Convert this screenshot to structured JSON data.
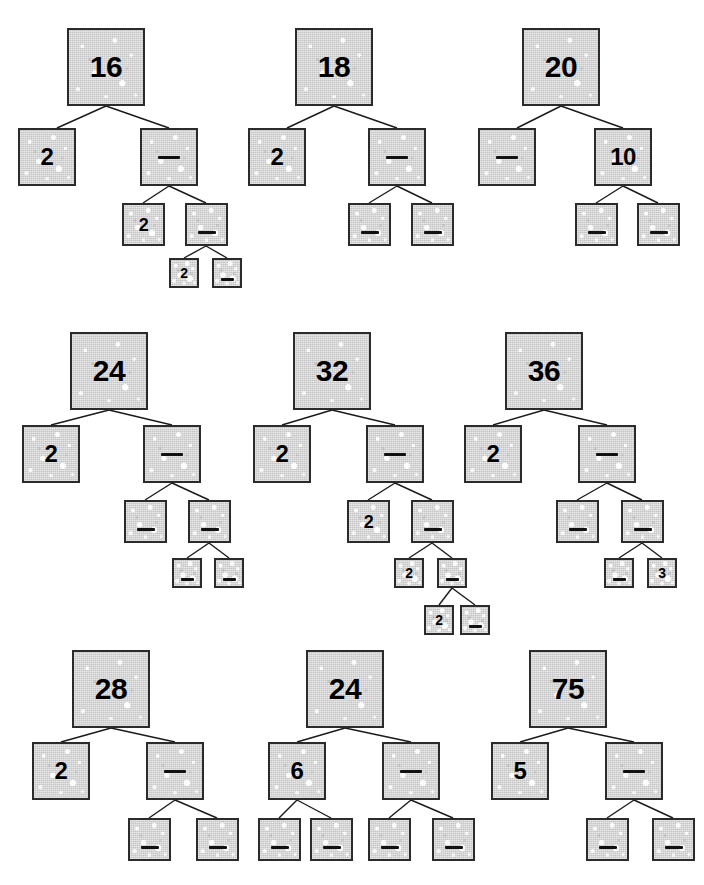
{
  "worksheet": {
    "title": "Factor Trees Worksheet",
    "blank_marker": "",
    "ink_color": "#1a1a1a",
    "box_fill_color": "#d9d9d9",
    "box_border_color": "#2b2b2b"
  },
  "trees": [
    {
      "id": "tree-16",
      "root_value": "16",
      "nodes": [
        {
          "name": "root",
          "value": "16",
          "blank": false,
          "size": 1,
          "x": 67,
          "y": 28
        },
        {
          "name": "l1-left",
          "value": "2",
          "blank": false,
          "size": 2,
          "x": 18,
          "y": 128
        },
        {
          "name": "l1-right",
          "value": "",
          "blank": true,
          "size": 2,
          "x": 140,
          "y": 128
        },
        {
          "name": "l2-left",
          "value": "2",
          "blank": false,
          "size": 3,
          "x": 122,
          "y": 203
        },
        {
          "name": "l2-right",
          "value": "",
          "blank": true,
          "size": 3,
          "x": 185,
          "y": 203
        },
        {
          "name": "l3-left",
          "value": "2",
          "blank": false,
          "size": 4,
          "x": 169,
          "y": 258
        },
        {
          "name": "l3-right",
          "value": "",
          "blank": true,
          "size": 4,
          "x": 212,
          "y": 258
        }
      ],
      "edges": [
        [
          106,
          106,
          57,
          128
        ],
        [
          106,
          106,
          169,
          128
        ],
        [
          169,
          186,
          143,
          203
        ],
        [
          169,
          186,
          206,
          203
        ],
        [
          206,
          246,
          184,
          258
        ],
        [
          206,
          246,
          227,
          258
        ]
      ]
    },
    {
      "id": "tree-18",
      "root_value": "18",
      "nodes": [
        {
          "name": "root",
          "value": "18",
          "blank": false,
          "size": 1,
          "x": 295,
          "y": 28
        },
        {
          "name": "l1-left",
          "value": "2",
          "blank": false,
          "size": 2,
          "x": 248,
          "y": 128
        },
        {
          "name": "l1-right",
          "value": "",
          "blank": true,
          "size": 2,
          "x": 368,
          "y": 128
        },
        {
          "name": "l2-left",
          "value": "",
          "blank": true,
          "size": 3,
          "x": 348,
          "y": 203
        },
        {
          "name": "l2-right",
          "value": "",
          "blank": true,
          "size": 3,
          "x": 411,
          "y": 203
        }
      ],
      "edges": [
        [
          334,
          106,
          287,
          128
        ],
        [
          334,
          106,
          397,
          128
        ],
        [
          397,
          186,
          369,
          203
        ],
        [
          397,
          186,
          432,
          203
        ]
      ]
    },
    {
      "id": "tree-20",
      "root_value": "20",
      "nodes": [
        {
          "name": "root",
          "value": "20",
          "blank": false,
          "size": 1,
          "x": 522,
          "y": 28
        },
        {
          "name": "l1-left",
          "value": "",
          "blank": true,
          "size": 2,
          "x": 478,
          "y": 128
        },
        {
          "name": "l1-right",
          "value": "10",
          "blank": false,
          "size": 2,
          "x": 594,
          "y": 128
        },
        {
          "name": "l2-left",
          "value": "",
          "blank": true,
          "size": 3,
          "x": 575,
          "y": 203
        },
        {
          "name": "l2-right",
          "value": "",
          "blank": true,
          "size": 3,
          "x": 637,
          "y": 203
        }
      ],
      "edges": [
        [
          561,
          106,
          517,
          128
        ],
        [
          561,
          106,
          623,
          128
        ],
        [
          623,
          186,
          596,
          203
        ],
        [
          623,
          186,
          658,
          203
        ]
      ]
    },
    {
      "id": "tree-24-a",
      "root_value": "24",
      "nodes": [
        {
          "name": "root",
          "value": "24",
          "blank": false,
          "size": 1,
          "x": 70,
          "y": 332
        },
        {
          "name": "l1-left",
          "value": "2",
          "blank": false,
          "size": 2,
          "x": 22,
          "y": 425
        },
        {
          "name": "l1-right",
          "value": "",
          "blank": true,
          "size": 2,
          "x": 143,
          "y": 425
        },
        {
          "name": "l2-left",
          "value": "",
          "blank": true,
          "size": 3,
          "x": 124,
          "y": 500
        },
        {
          "name": "l2-right",
          "value": "",
          "blank": true,
          "size": 3,
          "x": 188,
          "y": 500
        },
        {
          "name": "l3-left",
          "value": "",
          "blank": true,
          "size": 4,
          "x": 172,
          "y": 558
        },
        {
          "name": "l3-right",
          "value": "",
          "blank": true,
          "size": 4,
          "x": 214,
          "y": 558
        }
      ],
      "edges": [
        [
          109,
          410,
          51,
          425
        ],
        [
          109,
          410,
          172,
          425
        ],
        [
          172,
          483,
          145,
          500
        ],
        [
          172,
          483,
          209,
          500
        ],
        [
          209,
          543,
          187,
          558
        ],
        [
          209,
          543,
          229,
          558
        ]
      ]
    },
    {
      "id": "tree-32",
      "root_value": "32",
      "nodes": [
        {
          "name": "root",
          "value": "32",
          "blank": false,
          "size": 1,
          "x": 293,
          "y": 332
        },
        {
          "name": "l1-left",
          "value": "2",
          "blank": false,
          "size": 2,
          "x": 253,
          "y": 425
        },
        {
          "name": "l1-right",
          "value": "",
          "blank": true,
          "size": 2,
          "x": 366,
          "y": 425
        },
        {
          "name": "l2-left",
          "value": "2",
          "blank": false,
          "size": 3,
          "x": 347,
          "y": 500
        },
        {
          "name": "l2-right",
          "value": "",
          "blank": true,
          "size": 3,
          "x": 411,
          "y": 500
        },
        {
          "name": "l3-left",
          "value": "2",
          "blank": false,
          "size": 4,
          "x": 394,
          "y": 558
        },
        {
          "name": "l3-right",
          "value": "",
          "blank": true,
          "size": 4,
          "x": 437,
          "y": 558
        },
        {
          "name": "l4-left",
          "value": "2",
          "blank": false,
          "size": 4,
          "x": 424,
          "y": 605
        },
        {
          "name": "l4-right",
          "value": "",
          "blank": true,
          "size": 4,
          "x": 460,
          "y": 605
        }
      ],
      "edges": [
        [
          332,
          410,
          282,
          425
        ],
        [
          332,
          410,
          395,
          425
        ],
        [
          395,
          483,
          368,
          500
        ],
        [
          395,
          483,
          432,
          500
        ],
        [
          432,
          543,
          409,
          558
        ],
        [
          432,
          543,
          452,
          558
        ],
        [
          452,
          588,
          439,
          605
        ],
        [
          452,
          588,
          475,
          605
        ]
      ]
    },
    {
      "id": "tree-36",
      "root_value": "36",
      "nodes": [
        {
          "name": "root",
          "value": "36",
          "blank": false,
          "size": 1,
          "x": 505,
          "y": 332
        },
        {
          "name": "l1-left",
          "value": "2",
          "blank": false,
          "size": 2,
          "x": 464,
          "y": 425
        },
        {
          "name": "l1-right",
          "value": "",
          "blank": true,
          "size": 2,
          "x": 578,
          "y": 425
        },
        {
          "name": "l2-left",
          "value": "",
          "blank": true,
          "size": 3,
          "x": 556,
          "y": 500
        },
        {
          "name": "l2-right",
          "value": "",
          "blank": true,
          "size": 3,
          "x": 621,
          "y": 500
        },
        {
          "name": "l3-left",
          "value": "",
          "blank": true,
          "size": 4,
          "x": 604,
          "y": 558
        },
        {
          "name": "l3-right",
          "value": "3",
          "blank": false,
          "size": 4,
          "x": 647,
          "y": 558
        }
      ],
      "edges": [
        [
          544,
          410,
          493,
          425
        ],
        [
          544,
          410,
          607,
          425
        ],
        [
          607,
          483,
          577,
          500
        ],
        [
          607,
          483,
          642,
          500
        ],
        [
          642,
          543,
          619,
          558
        ],
        [
          642,
          543,
          662,
          558
        ]
      ]
    },
    {
      "id": "tree-28",
      "root_value": "28",
      "nodes": [
        {
          "name": "root",
          "value": "28",
          "blank": false,
          "size": 1,
          "x": 72,
          "y": 650
        },
        {
          "name": "l1-left",
          "value": "2",
          "blank": false,
          "size": 2,
          "x": 32,
          "y": 742
        },
        {
          "name": "l1-right",
          "value": "",
          "blank": true,
          "size": 2,
          "x": 146,
          "y": 742
        },
        {
          "name": "l2-left",
          "value": "",
          "blank": true,
          "size": 3,
          "x": 128,
          "y": 818
        },
        {
          "name": "l2-right",
          "value": "",
          "blank": true,
          "size": 3,
          "x": 196,
          "y": 818
        }
      ],
      "edges": [
        [
          111,
          728,
          61,
          742
        ],
        [
          111,
          728,
          175,
          742
        ],
        [
          175,
          800,
          149,
          818
        ],
        [
          175,
          800,
          217,
          818
        ]
      ]
    },
    {
      "id": "tree-24-b",
      "root_value": "24",
      "nodes": [
        {
          "name": "root",
          "value": "24",
          "blank": false,
          "size": 1,
          "x": 306,
          "y": 650
        },
        {
          "name": "l1-left",
          "value": "6",
          "blank": false,
          "size": 2,
          "x": 268,
          "y": 742
        },
        {
          "name": "l1-right",
          "value": "",
          "blank": true,
          "size": 2,
          "x": 382,
          "y": 742
        },
        {
          "name": "l2-a",
          "value": "",
          "blank": true,
          "size": 3,
          "x": 258,
          "y": 818
        },
        {
          "name": "l2-b",
          "value": "",
          "blank": true,
          "size": 3,
          "x": 310,
          "y": 818
        },
        {
          "name": "l2-c",
          "value": "",
          "blank": true,
          "size": 3,
          "x": 368,
          "y": 818
        },
        {
          "name": "l2-d",
          "value": "",
          "blank": true,
          "size": 3,
          "x": 432,
          "y": 818
        }
      ],
      "edges": [
        [
          345,
          728,
          297,
          742
        ],
        [
          345,
          728,
          411,
          742
        ],
        [
          297,
          800,
          279,
          818
        ],
        [
          297,
          800,
          331,
          818
        ],
        [
          411,
          800,
          389,
          818
        ],
        [
          411,
          800,
          453,
          818
        ]
      ]
    },
    {
      "id": "tree-75",
      "root_value": "75",
      "nodes": [
        {
          "name": "root",
          "value": "75",
          "blank": false,
          "size": 1,
          "x": 529,
          "y": 650
        },
        {
          "name": "l1-left",
          "value": "5",
          "blank": false,
          "size": 2,
          "x": 491,
          "y": 742
        },
        {
          "name": "l1-right",
          "value": "",
          "blank": true,
          "size": 2,
          "x": 605,
          "y": 742
        },
        {
          "name": "l2-left",
          "value": "",
          "blank": true,
          "size": 3,
          "x": 586,
          "y": 818
        },
        {
          "name": "l2-right",
          "value": "",
          "blank": true,
          "size": 3,
          "x": 652,
          "y": 818
        }
      ],
      "edges": [
        [
          568,
          728,
          520,
          742
        ],
        [
          568,
          728,
          634,
          742
        ],
        [
          634,
          800,
          607,
          818
        ],
        [
          634,
          800,
          673,
          818
        ]
      ]
    }
  ]
}
